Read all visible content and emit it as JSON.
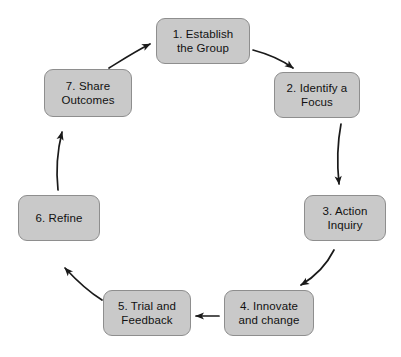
{
  "diagram": {
    "type": "cycle-flowchart",
    "direction": "clockwise",
    "colors": {
      "node_fill": "#c9c9c9",
      "node_border": "#8e8e8e",
      "node_text": "#111111",
      "arrow": "#1a1a1a",
      "background": "#ffffff"
    },
    "nodes": [
      {
        "id": "step-1",
        "label": "1. Establish\nthe Group",
        "x": 156,
        "y": 18,
        "w": 94,
        "h": 46
      },
      {
        "id": "step-2",
        "label": "2. Identify a\nFocus",
        "x": 274,
        "y": 72,
        "w": 86,
        "h": 46
      },
      {
        "id": "step-3",
        "label": "3. Action\nInquiry",
        "x": 304,
        "y": 195,
        "w": 82,
        "h": 46
      },
      {
        "id": "step-4",
        "label": "4. Innovate\nand change",
        "x": 224,
        "y": 290,
        "w": 90,
        "h": 46
      },
      {
        "id": "step-5",
        "label": "5. Trial and\nFeedback",
        "x": 103,
        "y": 290,
        "w": 88,
        "h": 46
      },
      {
        "id": "step-6",
        "label": "6. Refine",
        "x": 18,
        "y": 195,
        "w": 82,
        "h": 46
      },
      {
        "id": "step-7",
        "label": "7. Share\nOutcomes",
        "x": 44,
        "y": 69,
        "w": 88,
        "h": 48
      }
    ],
    "arrows": [
      {
        "id": "arrow-1-to-2",
        "from": "step-1",
        "to": "step-2"
      },
      {
        "id": "arrow-2-to-3",
        "from": "step-2",
        "to": "step-3"
      },
      {
        "id": "arrow-3-to-4",
        "from": "step-3",
        "to": "step-4"
      },
      {
        "id": "arrow-4-to-5",
        "from": "step-4",
        "to": "step-5"
      },
      {
        "id": "arrow-5-to-6",
        "from": "step-5",
        "to": "step-6"
      },
      {
        "id": "arrow-6-to-7",
        "from": "step-6",
        "to": "step-7"
      },
      {
        "id": "arrow-7-to-1",
        "from": "step-7",
        "to": "step-1"
      }
    ]
  }
}
